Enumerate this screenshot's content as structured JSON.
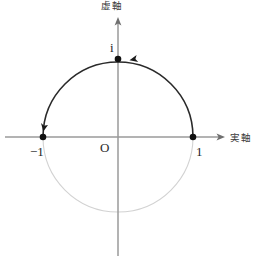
{
  "figure": {
    "labels": {
      "imaginary_axis": "虚軸",
      "real_axis": "実軸",
      "imaginary_unit": "i",
      "origin": "O",
      "negative_one": "−1",
      "positive_one": "1"
    },
    "colors": {
      "axis": "#9a9a9a",
      "arc_upper": "#2a2a2a",
      "arc_lower": "#d2d2d2",
      "point": "#111111",
      "background": "#ffffff",
      "text": "#2b2b2b"
    },
    "geometry": {
      "center_x": 118,
      "center_y": 137,
      "radius": 75,
      "axis_x_start": 5,
      "axis_x_end": 224,
      "axis_y_start": 18,
      "axis_y_end": 256
    },
    "points": [
      {
        "name": "minus-one",
        "label": "−1",
        "x": 43,
        "y": 137,
        "value_re": -1,
        "value_im": 0
      },
      {
        "name": "imaginary-unit",
        "label": "i",
        "x": 118,
        "y": 59,
        "value_re": 0,
        "value_im": 1
      },
      {
        "name": "one",
        "label": "1",
        "x": 193,
        "y": 137,
        "value_re": 1,
        "value_im": 0
      }
    ],
    "direction_arrows": [
      {
        "name": "arrow-near-i",
        "x": 133,
        "y": 61,
        "points": "left"
      },
      {
        "name": "arrow-near-minus-one",
        "x": 45,
        "y": 124,
        "points": "down-left"
      }
    ]
  }
}
